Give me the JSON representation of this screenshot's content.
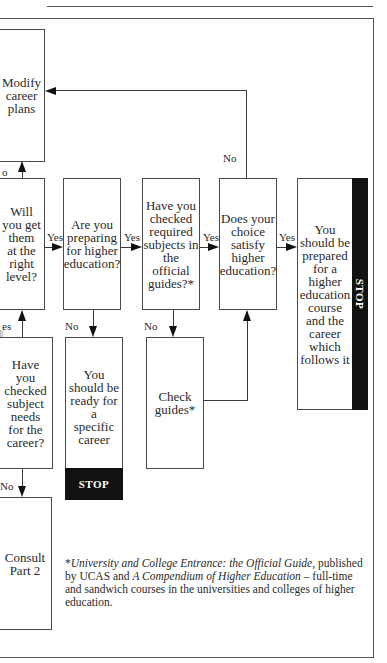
{
  "boxes": {
    "modify": "Modify career plans",
    "will": [
      "Will",
      "you get",
      "them",
      "at the",
      "right",
      "level?"
    ],
    "preparing": [
      "Are you",
      "preparing",
      "for higher",
      "education?"
    ],
    "checked_required": [
      "Have you",
      "checked",
      "required",
      "subjects in",
      "the official",
      "guides?*"
    ],
    "satisfy": [
      "Does your",
      "choice",
      "satisfy",
      "higher",
      "education?"
    ],
    "prepared_he": [
      "You",
      "should be",
      "prepared",
      "for a",
      "higher",
      "education",
      "course",
      "and the",
      "career",
      "which",
      "follows it"
    ],
    "checked_subject": [
      "Have",
      "you",
      "checked",
      "subject",
      "needs",
      "for the",
      "career?"
    ],
    "ready_career": [
      "You",
      "should be",
      "ready for a",
      "specific",
      "career"
    ],
    "check_guides": [
      "Check",
      "guides*"
    ],
    "consult": [
      "Consult",
      "Part 2"
    ]
  },
  "modify_lines": [
    "Modify",
    "career",
    "plans"
  ],
  "stop_label": "STOP",
  "labels": {
    "yes": "Yes",
    "no": "No",
    "no_partial": "o",
    "yes_partial": "es",
    "no_partial2": "No"
  },
  "footnote": {
    "marker": "*",
    "title1": "University and College Entrance: the Official Guide",
    "text1": ", published by UCAS and ",
    "title2": "A Compendium of Higher Education",
    "text2": " – full-time and sandwich courses in the universities and colleges of higher education."
  }
}
